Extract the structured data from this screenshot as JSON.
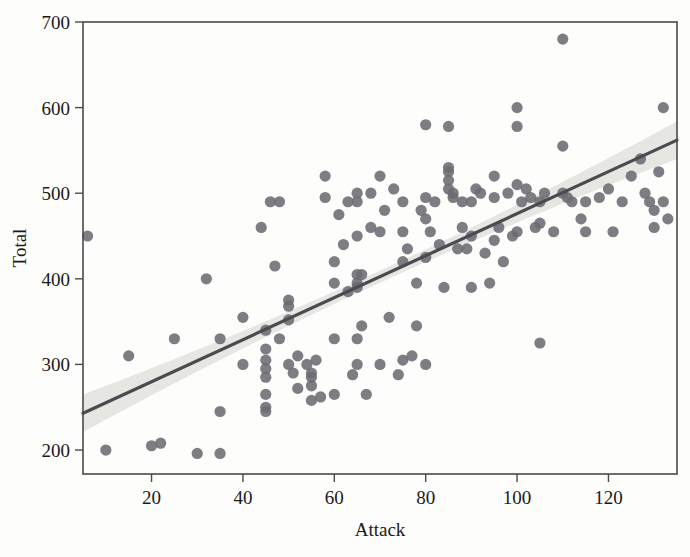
{
  "chart_data": {
    "type": "scatter",
    "title": "",
    "xlabel": "Attack",
    "ylabel": "Total",
    "xlim": [
      5,
      135
    ],
    "ylim": [
      172,
      700
    ],
    "xticks": [
      20,
      40,
      60,
      80,
      100,
      120
    ],
    "yticks": [
      200,
      300,
      400,
      500,
      600,
      700
    ],
    "grid": false,
    "legend": null,
    "marker_color": "#6b6b72",
    "line_color": "#4a4a50",
    "band_color": "#c9c9c4",
    "frame_color": "#4a4a4a",
    "background_color": "#fdfdfb",
    "fit": {
      "type": "linear-regression",
      "x_start": 5,
      "y_start": 243,
      "x_end": 135,
      "y_end": 562,
      "slope": 2.454,
      "intercept": 230.7,
      "confidence_band": true,
      "band_halfwidth_min": 7,
      "band_halfwidth_end": 22
    },
    "x": [
      6,
      10,
      15,
      20,
      22,
      25,
      30,
      32,
      35,
      35,
      35,
      40,
      40,
      44,
      45,
      45,
      45,
      45,
      45,
      45,
      45,
      45,
      46,
      47,
      48,
      48,
      50,
      50,
      50,
      50,
      51,
      52,
      52,
      54,
      55,
      55,
      55,
      55,
      56,
      57,
      58,
      58,
      60,
      60,
      60,
      60,
      61,
      62,
      63,
      63,
      64,
      65,
      65,
      65,
      65,
      65,
      65,
      65,
      65,
      66,
      66,
      67,
      68,
      68,
      70,
      70,
      70,
      71,
      72,
      73,
      74,
      75,
      75,
      75,
      75,
      76,
      77,
      78,
      78,
      79,
      80,
      80,
      80,
      80,
      80,
      81,
      82,
      83,
      84,
      85,
      85,
      85,
      85,
      85,
      86,
      86,
      87,
      88,
      88,
      89,
      90,
      90,
      90,
      91,
      92,
      93,
      94,
      95,
      95,
      95,
      96,
      97,
      98,
      99,
      100,
      100,
      100,
      100,
      101,
      102,
      103,
      104,
      105,
      105,
      105,
      106,
      108,
      110,
      110,
      110,
      111,
      112,
      114,
      115,
      115,
      118,
      120,
      121,
      123,
      125,
      127,
      128,
      129,
      130,
      130,
      131,
      132,
      132,
      133
    ],
    "y": [
      450,
      200,
      310,
      205,
      208,
      330,
      196,
      400,
      196,
      330,
      245,
      300,
      355,
      460,
      340,
      318,
      305,
      295,
      285,
      265,
      250,
      245,
      490,
      415,
      490,
      330,
      375,
      368,
      352,
      300,
      290,
      310,
      272,
      300,
      290,
      285,
      275,
      258,
      305,
      262,
      520,
      495,
      420,
      395,
      330,
      265,
      475,
      440,
      490,
      385,
      288,
      500,
      490,
      450,
      405,
      395,
      390,
      330,
      300,
      405,
      345,
      265,
      460,
      500,
      520,
      455,
      300,
      480,
      355,
      505,
      288,
      490,
      455,
      420,
      305,
      435,
      310,
      395,
      345,
      480,
      580,
      495,
      470,
      425,
      300,
      455,
      490,
      440,
      390,
      578,
      530,
      525,
      515,
      505,
      500,
      495,
      435,
      490,
      460,
      435,
      490,
      450,
      390,
      505,
      500,
      430,
      395,
      520,
      495,
      445,
      460,
      420,
      500,
      450,
      600,
      578,
      510,
      455,
      490,
      505,
      495,
      460,
      490,
      465,
      325,
      500,
      455,
      680,
      555,
      500,
      495,
      490,
      470,
      490,
      455,
      495,
      505,
      455,
      490,
      520,
      540,
      500,
      490,
      480,
      460,
      525,
      600,
      490,
      470
    ]
  }
}
